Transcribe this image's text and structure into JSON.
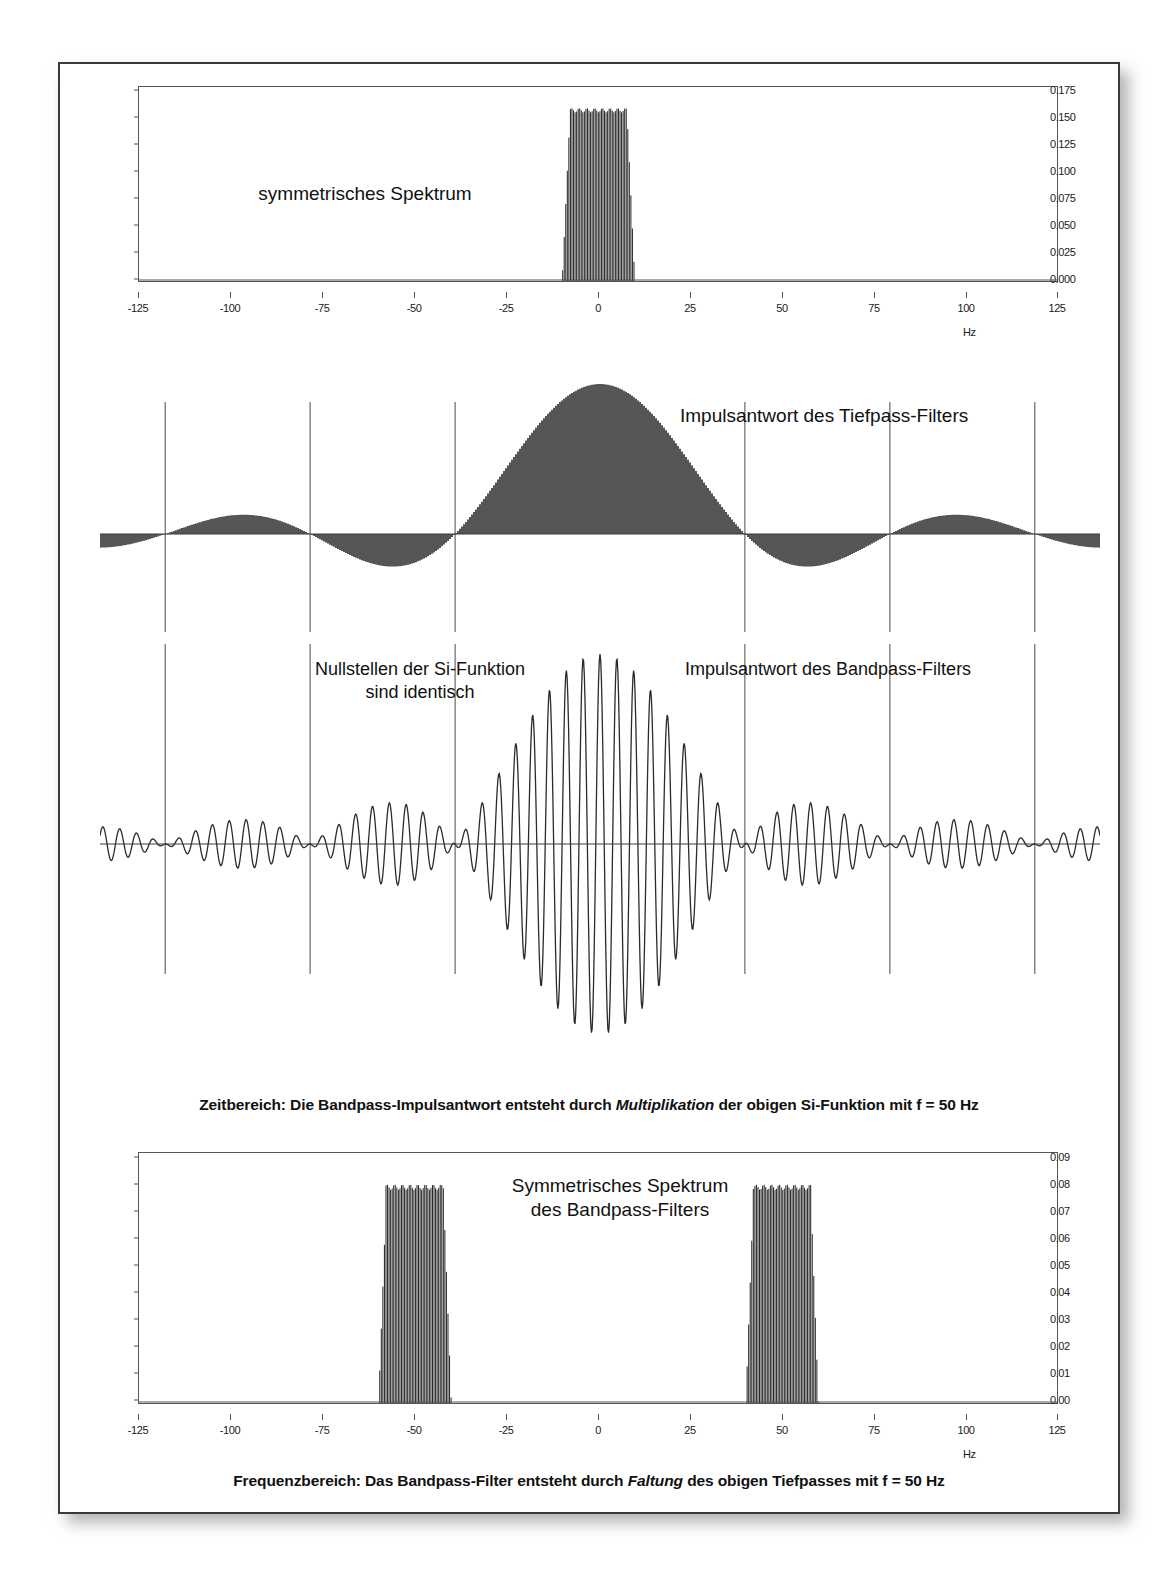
{
  "figure": {
    "title_absent": true,
    "background": "#ffffff",
    "frame_color": "#3a3a3a"
  },
  "panel1": {
    "name": "lowpass-spectrum",
    "annotation": "symmetrisches Spektrum",
    "unit": "Hz",
    "yticks": [
      "0.000",
      "0.025",
      "0.050",
      "0.075",
      "0.100",
      "0.125",
      "0.150",
      "0.175"
    ],
    "xticks": [
      "-125",
      "-100",
      "-75",
      "-50",
      "-25",
      "0",
      "25",
      "50",
      "75",
      "100",
      "125"
    ]
  },
  "panel2": {
    "name": "lowpass-impulse-response",
    "annotation": "Impulsantwort des Tiefpass-Filters"
  },
  "panel3": {
    "name": "bandpass-impulse-response",
    "annotation_left": "Nullstellen der Si-Funktion\nsind identisch",
    "annotation_right": "Impulsantwort des Bandpass-Filters",
    "caption_pre": "Zeitbereich: Die Bandpass-Impulsantwort entsteht durch ",
    "caption_em": "Multiplikation",
    "caption_post": " der obigen Si-Funktion mit f = 50 Hz"
  },
  "panel4": {
    "name": "bandpass-spectrum",
    "annotation": "Symmetrisches Spektrum\ndes Bandpass-Filters",
    "unit": "Hz",
    "yticks": [
      "0.00",
      "0.01",
      "0.02",
      "0.03",
      "0.04",
      "0.05",
      "0.06",
      "0.07",
      "0.08",
      "0.09"
    ],
    "xticks": [
      "-125",
      "-100",
      "-75",
      "-50",
      "-25",
      "0",
      "25",
      "50",
      "75",
      "100",
      "125"
    ],
    "caption_pre": "Frequenzbereich: Das Bandpass-Filter entsteht durch ",
    "caption_em": "Faltung",
    "caption_post": " des obigen Tiefpasses mit f = 50 Hz"
  },
  "chart_data": [
    {
      "type": "bar",
      "id": "lowpass-spectrum",
      "title": "symmetrisches Spektrum",
      "xlabel": "Hz",
      "ylabel": "",
      "xlim": [
        -125,
        125
      ],
      "ylim": [
        0,
        0.1875
      ],
      "ytick_values": [
        0.0,
        0.025,
        0.05,
        0.075,
        0.1,
        0.125,
        0.15,
        0.175
      ],
      "xtick_values": [
        -125,
        -100,
        -75,
        -50,
        -25,
        0,
        25,
        50,
        75,
        100,
        125
      ],
      "grid": false,
      "legend": "none",
      "description": "Rectangular lowpass passband centred on 0 Hz, flat top at 0.165, band edges near -9 and +9 Hz with steep roll-off",
      "passband": {
        "center": 0,
        "half_width": 9,
        "plateau": 0.165
      },
      "x": [
        -125,
        -20,
        -12,
        -10,
        -9,
        -8,
        -6,
        -4,
        -2,
        0,
        2,
        4,
        6,
        8,
        9,
        10,
        12,
        20,
        125
      ],
      "y": [
        0.0,
        0.0,
        0.002,
        0.02,
        0.09,
        0.155,
        0.163,
        0.165,
        0.166,
        0.166,
        0.166,
        0.165,
        0.163,
        0.155,
        0.09,
        0.02,
        0.002,
        0.0,
        0.0
      ]
    },
    {
      "type": "bar",
      "id": "lowpass-impulse-response",
      "title": "Impulsantwort des Tiefpass-Filters",
      "xlabel": "",
      "ylabel": "",
      "grid": false,
      "legend": "none",
      "description": "Si (sinc) function impulse response, main lobe centred at t=0, symmetric decaying side lobes; vertical reference lines drawn at the sinc zero crossings",
      "zero_crossing_lines": [
        -3,
        -2,
        -1,
        1,
        2,
        3
      ],
      "function": "sinc",
      "main_lobe_amplitude": 1.0,
      "sidelobe_amplitudes": [
        -0.217,
        0.128,
        -0.091
      ]
    },
    {
      "type": "line",
      "id": "bandpass-impulse-response",
      "title": "Impulsantwort des Bandpass-Filters",
      "xlabel": "",
      "ylabel": "",
      "grid": false,
      "legend": "none",
      "description": "Si function multiplied by a 50 Hz cosine carrier, giving a rapidly oscillating burst whose envelope equals the sinc above; same zero crossings",
      "zero_crossing_lines": [
        -3,
        -2,
        -1,
        1,
        2,
        3
      ],
      "carrier_hz": 50,
      "envelope": "sinc"
    },
    {
      "type": "bar",
      "id": "bandpass-spectrum",
      "title": "Symmetrisches Spektrum des Bandpass-Filters",
      "xlabel": "Hz",
      "ylabel": "",
      "xlim": [
        -125,
        125
      ],
      "ylim": [
        0,
        0.095
      ],
      "ytick_values": [
        0.0,
        0.01,
        0.02,
        0.03,
        0.04,
        0.05,
        0.06,
        0.07,
        0.08,
        0.09
      ],
      "xtick_values": [
        -125,
        -100,
        -75,
        -50,
        -25,
        0,
        25,
        50,
        75,
        100,
        125
      ],
      "grid": false,
      "legend": "none",
      "description": "Two symmetric rectangular passbands centred at -50 Hz and +50 Hz, flat tops at 0.082, each about 18 Hz wide",
      "passbands": [
        {
          "center": -50,
          "half_width": 9,
          "plateau": 0.082
        },
        {
          "center": 50,
          "half_width": 9,
          "plateau": 0.082
        }
      ]
    }
  ]
}
